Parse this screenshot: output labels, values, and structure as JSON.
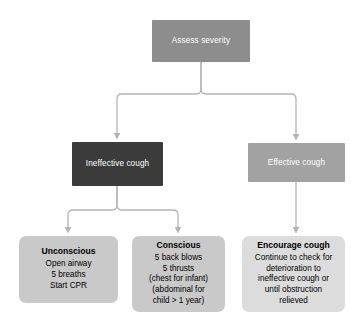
{
  "diagram": {
    "nodes": {
      "assess": {
        "label": "Assess severity",
        "color": "#8d8d8d",
        "text_color": "#ffffff"
      },
      "ineffective": {
        "label": "Ineffective cough",
        "color": "#3b3b3b",
        "text_color": "#ffffff"
      },
      "effective": {
        "label": "Effective cough",
        "color": "#a2a2a2",
        "text_color": "#ffffff"
      },
      "unconscious": {
        "heading": "Unconscious",
        "lines": [
          "Open airway",
          "5 breaths",
          "Start CPR"
        ],
        "color": "#c9c9c9",
        "text_color": "#000000"
      },
      "conscious": {
        "heading": "Conscious",
        "lines": [
          "5 back blows",
          "5 thrusts",
          "(chest for infant)",
          "(abdominal for",
          "child > 1 year)"
        ],
        "color": "#c9c9c9",
        "text_color": "#000000"
      },
      "encourage": {
        "heading": "Encourage cough",
        "lines": [
          "Continue to check for",
          "deterioration to",
          "ineffective cough or",
          "until obstruction",
          "relieved"
        ],
        "color": "#dcdcdc",
        "text_color": "#000000"
      }
    },
    "connector_color": "#b4b4b4",
    "background": "#ffffff"
  }
}
